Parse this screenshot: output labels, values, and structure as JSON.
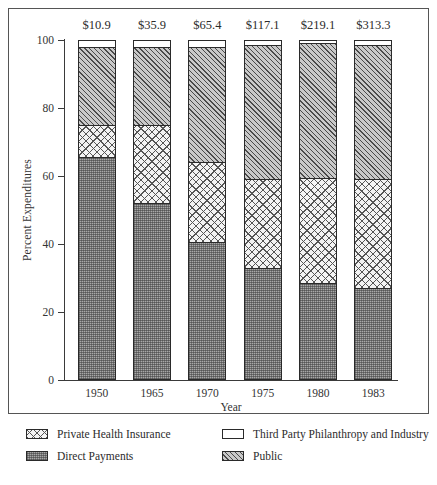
{
  "chart_data": {
    "type": "bar",
    "subtype": "stacked-bar-100-percent",
    "title": "",
    "xlabel": "Year",
    "ylabel": "Percent Expenditures",
    "ylim": [
      0,
      100
    ],
    "yticks": [
      0,
      20,
      40,
      60,
      80,
      100
    ],
    "ytick_labels": [
      "0",
      "20",
      "40",
      "60",
      "80",
      "100"
    ],
    "grid": false,
    "legend_position": "below-axes",
    "categories": [
      "1950",
      "1965",
      "1970",
      "1975",
      "1980",
      "1983"
    ],
    "bar_totals": [
      "$10.9",
      "$35.9",
      "$65.4",
      "$117.1",
      "$219.1",
      "$313.3"
    ],
    "stack_order_bottom_to_top": [
      "Direct Payments",
      "Private Health Insurance",
      "Public",
      "Third Party Philanthropy and Industry"
    ],
    "series": [
      {
        "name": "Direct Payments",
        "fill": "direct",
        "values": [
          65.5,
          52,
          40.5,
          32.8,
          28.5,
          27.2
        ]
      },
      {
        "name": "Private Health Insurance",
        "fill": "private",
        "values": [
          9.5,
          23,
          23.5,
          26.2,
          31,
          32
        ]
      },
      {
        "name": "Public",
        "fill": "public",
        "values": [
          23,
          23,
          34,
          39.5,
          39.5,
          39.3
        ]
      },
      {
        "name": "Third Party Philanthropy and Industry",
        "fill": "third",
        "values": [
          2,
          2,
          2,
          1.5,
          1,
          1.5
        ]
      }
    ],
    "legend": [
      {
        "label": "Private Health Insurance",
        "fill": "private"
      },
      {
        "label": "Third Party Philanthropy and Industry",
        "fill": "third"
      },
      {
        "label": "Direct Payments",
        "fill": "direct"
      },
      {
        "label": "Public",
        "fill": "public"
      }
    ]
  }
}
